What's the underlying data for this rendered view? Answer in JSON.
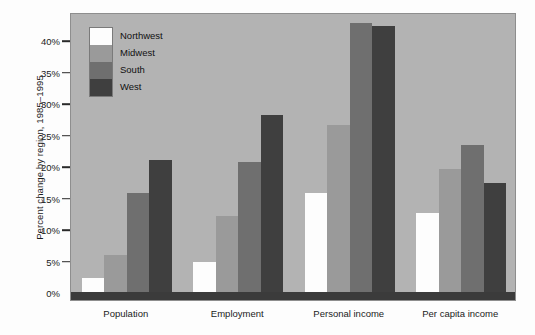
{
  "chart_data": {
    "type": "bar",
    "title": "",
    "xlabel": "",
    "ylabel": "Percent change by region, 1985–1995",
    "categories": [
      "Population",
      "Employment",
      "Personal income",
      "Per capita income"
    ],
    "series": [
      {
        "name": "Northwest",
        "color": "#fdfdfd",
        "values": [
          2.3,
          4.7,
          15.7,
          12.5
        ]
      },
      {
        "name": "Midwest",
        "color": "#9a9a9a",
        "values": [
          5.9,
          12.1,
          26.5,
          19.5
        ]
      },
      {
        "name": "South",
        "color": "#6f6f6f",
        "values": [
          15.7,
          20.6,
          42.8,
          23.3
        ]
      },
      {
        "name": "West",
        "color": "#3f3f3f",
        "values": [
          21.0,
          28.1,
          42.2,
          17.3
        ]
      }
    ],
    "ylim": [
      0,
      44.5
    ],
    "yticks": [
      0,
      5,
      10,
      15,
      20,
      25,
      30,
      35,
      40
    ],
    "ytick_labels": [
      "0%",
      "5%",
      "10%",
      "15%",
      "20%",
      "25%",
      "30%",
      "35%",
      "40%"
    ],
    "grid": false,
    "legend_position": "upper-left-inside",
    "plot_background": "#b3b3b3",
    "figure_background": "#fdfdfd"
  }
}
